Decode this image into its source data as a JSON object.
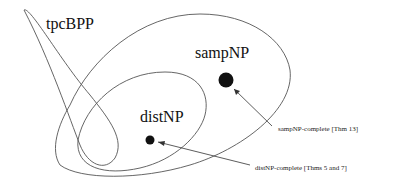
{
  "diagram": {
    "type": "nested-region diagram",
    "regions": [
      {
        "id": "tpcBPP",
        "label": "tpcBPP"
      },
      {
        "id": "sampNP",
        "label": "sampNP"
      },
      {
        "id": "distNP",
        "label": "distNP"
      }
    ],
    "points": [
      {
        "id": "sampNP-complete",
        "annotation": "sampNP-complete [Thm 13]"
      },
      {
        "id": "distNP-complete",
        "annotation": "distNP-complete [Thms 5 and 7]"
      }
    ],
    "colors": {
      "stroke": "#555555",
      "dot": "#111111",
      "text": "#111111"
    }
  }
}
